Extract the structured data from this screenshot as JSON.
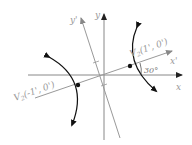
{
  "diagram": {
    "axes": {
      "x_label": "x",
      "y_label": "y",
      "x_prime_label": "x'",
      "y_prime_label": "y'"
    },
    "angle_label": "30°",
    "vertices": [
      {
        "label_main": "V",
        "label_sub": "2",
        "label_coords": "(1', 0')"
      },
      {
        "label_main": "V",
        "label_sub": "2",
        "label_coords": "(-1', 0')"
      }
    ],
    "colors": {
      "axis": "#888888",
      "rotated_axis": "#9a9a9a",
      "curve": "#111111",
      "text": "#999999"
    }
  }
}
